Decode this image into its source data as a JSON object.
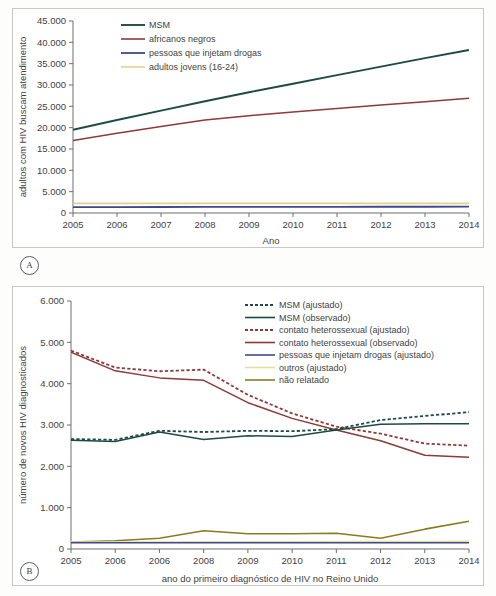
{
  "figure": {
    "panel_a_tag": "A",
    "panel_b_tag": "B"
  },
  "chart_data": [
    {
      "id": "panel-a",
      "type": "line",
      "title": "",
      "xlabel": "Ano",
      "ylabel": "adultos com HIV buscam atendimento",
      "x": [
        2005,
        2006,
        2007,
        2008,
        2009,
        2010,
        2011,
        2012,
        2013,
        2014
      ],
      "xtick_labels": [
        "2005",
        "2006",
        "2007",
        "2008",
        "2009",
        "2010",
        "2011",
        "2012",
        "2013",
        "2014"
      ],
      "ytick_labels": [
        "0",
        "5.000",
        "10.000",
        "15.000",
        "20.000",
        "25.000",
        "30.000",
        "35.000",
        "40.000",
        "45.000"
      ],
      "yticks": [
        0,
        5000,
        10000,
        15000,
        20000,
        25000,
        30000,
        35000,
        40000,
        45000
      ],
      "ylim": [
        0,
        45000
      ],
      "xlim": [
        2005,
        2014
      ],
      "grid": false,
      "legend_position": "top-left",
      "series": [
        {
          "name": "MSM",
          "color": "#1d4a42",
          "style": "solid",
          "width": 1.9,
          "values": [
            19500,
            21800,
            24000,
            26200,
            28300,
            30300,
            32300,
            34300,
            36300,
            38200
          ]
        },
        {
          "name": "africanos negros",
          "color": "#8d3a38",
          "style": "solid",
          "width": 1.5,
          "values": [
            17000,
            18700,
            20300,
            21800,
            22800,
            23700,
            24500,
            25300,
            26100,
            26900
          ]
        },
        {
          "name": "pessoas que injetam drogas",
          "color": "#3d4a8c",
          "style": "solid",
          "width": 1.8,
          "values": [
            1400,
            1400,
            1410,
            1420,
            1430,
            1440,
            1450,
            1460,
            1470,
            1480
          ]
        },
        {
          "name": "adultos jovens (16-24)",
          "color": "#e8cf89",
          "style": "solid",
          "width": 1.6,
          "values": [
            2250,
            2250,
            2250,
            2250,
            2250,
            2250,
            2250,
            2250,
            2250,
            2250
          ]
        }
      ]
    },
    {
      "id": "panel-b",
      "type": "line",
      "title": "",
      "xlabel": "ano do primeiro diagnóstico de HIV no Reino Unido",
      "ylabel": "número de novos HIV diagnosticados",
      "x": [
        2005,
        2006,
        2007,
        2008,
        2009,
        2010,
        2011,
        2012,
        2013,
        2014
      ],
      "xtick_labels": [
        "2005",
        "2006",
        "2006",
        "2008",
        "2009",
        "2010",
        "2011",
        "2012",
        "2013",
        "2014"
      ],
      "ytick_labels": [
        "0",
        "1.000",
        "2.000",
        "3.000",
        "4.000",
        "5.000",
        "6.000"
      ],
      "yticks": [
        0,
        1000,
        2000,
        3000,
        4000,
        5000,
        6000
      ],
      "ylim": [
        0,
        6000
      ],
      "xlim": [
        2005,
        2014
      ],
      "grid": false,
      "legend_position": "top-right",
      "series": [
        {
          "name": "MSM (ajustado)",
          "color": "#1d4a42",
          "style": "dashed",
          "width": 1.8,
          "values": [
            2660,
            2640,
            2860,
            2830,
            2860,
            2850,
            2900,
            3120,
            3220,
            3310
          ]
        },
        {
          "name": "MSM (observado)",
          "color": "#1d4a42",
          "style": "solid",
          "width": 1.5,
          "values": [
            2630,
            2600,
            2830,
            2650,
            2740,
            2720,
            2880,
            3020,
            3030,
            3030
          ]
        },
        {
          "name": "contato heterossexual (ajustado)",
          "color": "#8d3a38",
          "style": "dashed",
          "width": 1.8,
          "values": [
            4800,
            4390,
            4300,
            4340,
            3730,
            3280,
            2960,
            2790,
            2550,
            2500
          ]
        },
        {
          "name": "contato heterossexual (observado)",
          "color": "#8d3a38",
          "style": "solid",
          "width": 1.5,
          "values": [
            4760,
            4310,
            4140,
            4080,
            3540,
            3160,
            2880,
            2620,
            2270,
            2220
          ]
        },
        {
          "name": "pessoas que injetam drogas (ajustado)",
          "color": "#3d4a8c",
          "style": "solid",
          "width": 1.6,
          "values": [
            150,
            150,
            150,
            150,
            150,
            150,
            150,
            150,
            150,
            150
          ]
        },
        {
          "name": "outros (ajustado)",
          "color": "#e4dfa0",
          "style": "solid",
          "width": 1.6,
          "values": [
            170,
            170,
            170,
            175,
            175,
            175,
            180,
            180,
            180,
            185
          ]
        },
        {
          "name": "não relatado",
          "color": "#8c7a23",
          "style": "solid",
          "width": 1.6,
          "values": [
            170,
            200,
            260,
            440,
            370,
            370,
            380,
            260,
            480,
            670
          ]
        }
      ]
    }
  ]
}
